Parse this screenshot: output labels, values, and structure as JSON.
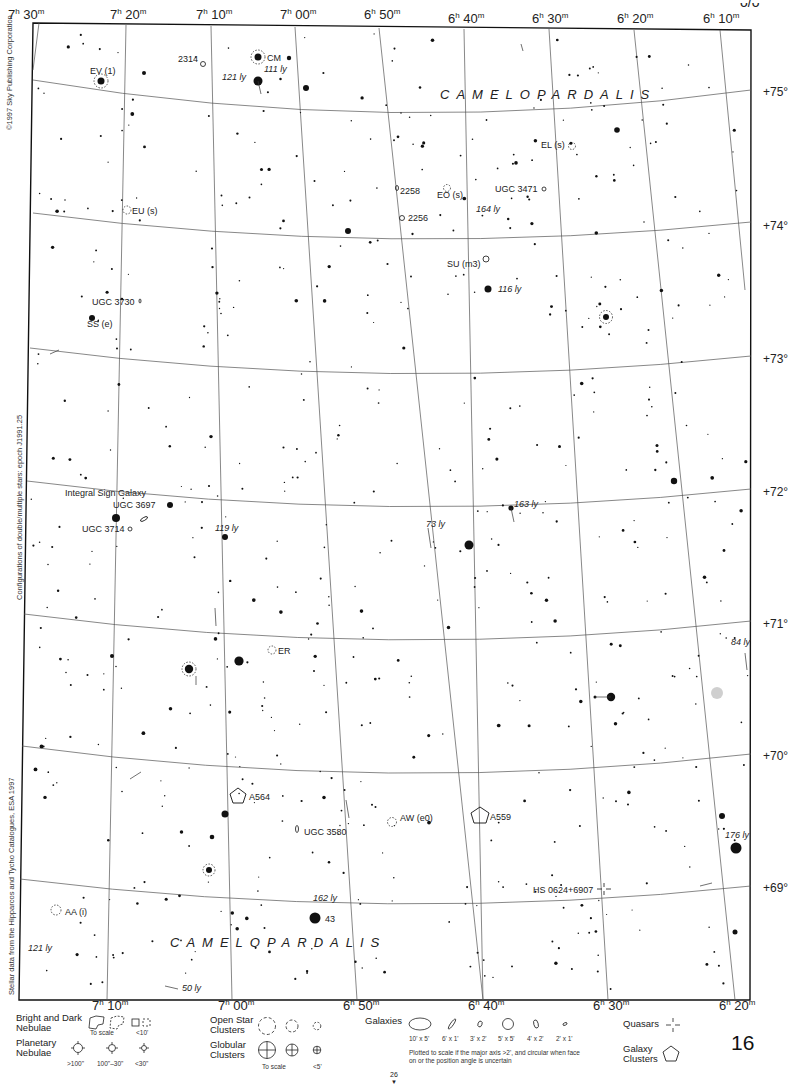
{
  "page": {
    "number": "16",
    "ref_page": "26",
    "top_corner_fragment": "ᴗ/ᴗ"
  },
  "side_text": {
    "copyright": "©1997 Sky Publishing Corporation",
    "epoch_note": "Configurations of double/multiple stars: epoch J1991.25",
    "stellar_data": "Stellar data from the Hipparcos and Tycho Catalogues, ESA 1997"
  },
  "constellation_labels": [
    {
      "text": "CAMELOPARDALIS",
      "x": 440,
      "y": 99
    },
    {
      "text": "CAMELOPARDALIS",
      "x": 170,
      "y": 947
    }
  ],
  "ra_top": [
    {
      "h": "7",
      "m": "30",
      "x": 8,
      "y": 20
    },
    {
      "h": "7",
      "m": "20",
      "x": 110,
      "y": 20
    },
    {
      "h": "7",
      "m": "10",
      "x": 197,
      "y": 20
    },
    {
      "h": "7",
      "m": "00",
      "x": 282,
      "y": 20
    },
    {
      "h": "6",
      "m": "50",
      "x": 365,
      "y": 20
    },
    {
      "h": "6",
      "m": "40",
      "x": 448,
      "y": 24
    },
    {
      "h": "6",
      "m": "30",
      "x": 532,
      "y": 24
    },
    {
      "h": "6",
      "m": "20",
      "x": 617,
      "y": 24
    },
    {
      "h": "6",
      "m": "10",
      "x": 703,
      "y": 24
    }
  ],
  "ra_bottom": [
    {
      "h": "7",
      "m": "10",
      "x": 92,
      "y": 1006
    },
    {
      "h": "7",
      "m": "00",
      "x": 218,
      "y": 1006
    },
    {
      "h": "6",
      "m": "50",
      "x": 343,
      "y": 1006
    },
    {
      "h": "6",
      "m": "40",
      "x": 468,
      "y": 1006
    },
    {
      "h": "6",
      "m": "30",
      "x": 593,
      "y": 1006
    },
    {
      "h": "6",
      "m": "20",
      "x": 719,
      "y": 1006
    }
  ],
  "dec_labels": [
    {
      "text": "+75°",
      "x": 763,
      "y": 96
    },
    {
      "text": "+74°",
      "x": 763,
      "y": 230
    },
    {
      "text": "+73°",
      "x": 763,
      "y": 363
    },
    {
      "text": "+72°",
      "x": 763,
      "y": 496
    },
    {
      "text": "+71°",
      "x": 763,
      "y": 628
    },
    {
      "text": "+70°",
      "x": 763,
      "y": 760
    },
    {
      "text": "+69°",
      "x": 763,
      "y": 892
    }
  ],
  "objects": [
    {
      "label": "2314",
      "x": 178,
      "y": 62,
      "type": "galaxy"
    },
    {
      "label": "CM",
      "x": 267,
      "y": 60,
      "type": "variable"
    },
    {
      "label": "EV (1)",
      "x": 90,
      "y": 74,
      "type": "variable"
    },
    {
      "label": "121 ly",
      "x": 222,
      "y": 79,
      "type": "distance"
    },
    {
      "label": "111 ly",
      "x": 264,
      "y": 72,
      "type": "distance"
    },
    {
      "label": "EL (s)",
      "x": 541,
      "y": 148,
      "type": "variable"
    },
    {
      "label": "2258",
      "x": 398,
      "y": 192,
      "type": "galaxy"
    },
    {
      "label": "EO (s)",
      "x": 437,
      "y": 198,
      "type": "variable"
    },
    {
      "label": "UGC 3471",
      "x": 495,
      "y": 192,
      "type": "galaxy"
    },
    {
      "label": "2256",
      "x": 407,
      "y": 221,
      "type": "galaxy"
    },
    {
      "label": "164 ly",
      "x": 476,
      "y": 212,
      "type": "distance"
    },
    {
      "label": "EU (s)",
      "x": 132,
      "y": 214,
      "type": "variable"
    },
    {
      "label": "SU (m3)",
      "x": 447,
      "y": 266,
      "type": "variable"
    },
    {
      "label": "116 ly",
      "x": 498,
      "y": 292,
      "type": "distance"
    },
    {
      "label": "UGC 3730",
      "x": 92,
      "y": 305,
      "type": "galaxy"
    },
    {
      "label": "SS (e)",
      "x": 87,
      "y": 327,
      "type": "variable"
    },
    {
      "label": "Integral Sign Galaxy",
      "x": 65,
      "y": 495,
      "type": "note"
    },
    {
      "label": "UGC 3697",
      "x": 113,
      "y": 508,
      "type": "galaxy"
    },
    {
      "label": "UGC 3714",
      "x": 82,
      "y": 531,
      "type": "galaxy"
    },
    {
      "label": "119 ly",
      "x": 215,
      "y": 531,
      "type": "distance"
    },
    {
      "label": "163 ly",
      "x": 514,
      "y": 508,
      "type": "distance"
    },
    {
      "label": "73 ly",
      "x": 426,
      "y": 527,
      "type": "distance"
    },
    {
      "label": "ER",
      "x": 278,
      "y": 653,
      "type": "variable"
    },
    {
      "label": "84 ly",
      "x": 731,
      "y": 646,
      "type": "distance"
    },
    {
      "label": "A564",
      "x": 249,
      "y": 799,
      "type": "cluster"
    },
    {
      "label": "UGC 3580",
      "x": 304,
      "y": 834,
      "type": "galaxy"
    },
    {
      "label": "AW (e0)",
      "x": 400,
      "y": 821,
      "type": "variable"
    },
    {
      "label": "A559",
      "x": 490,
      "y": 819,
      "type": "cluster"
    },
    {
      "label": "176 ly",
      "x": 725,
      "y": 838,
      "type": "distance"
    },
    {
      "label": "HS 0624+6907",
      "x": 533,
      "y": 892,
      "type": "quasar"
    },
    {
      "label": "162 ly",
      "x": 313,
      "y": 901,
      "type": "distance"
    },
    {
      "label": "AA (i)",
      "x": 65,
      "y": 915,
      "type": "variable"
    },
    {
      "label": "43",
      "x": 325,
      "y": 922,
      "type": "star"
    },
    {
      "label": "121 ly",
      "x": 28,
      "y": 951,
      "type": "distance"
    },
    {
      "label": "50 ly",
      "x": 182,
      "y": 991,
      "type": "distance"
    }
  ],
  "bright_stars": [
    [
      258,
      81,
      4.5
    ],
    [
      258,
      57,
      3.5
    ],
    [
      101,
      81,
      3.5
    ],
    [
      289,
      58,
      2.2
    ],
    [
      306,
      88,
      3
    ],
    [
      144,
      73,
      2
    ],
    [
      617,
      130,
      2.8
    ],
    [
      348,
      231,
      3
    ],
    [
      488,
      289,
      3.5
    ],
    [
      606,
      317,
      3
    ],
    [
      92,
      318,
      3
    ],
    [
      116,
      518,
      4
    ],
    [
      170,
      505,
      3
    ],
    [
      469,
      545,
      4.5
    ],
    [
      225,
      537,
      3
    ],
    [
      674,
      481,
      3.2
    ],
    [
      511,
      508,
      2.6
    ],
    [
      239,
      661,
      4.6
    ],
    [
      189,
      669,
      4.2
    ],
    [
      611,
      697,
      4.2
    ],
    [
      225,
      814,
      3.5
    ],
    [
      212,
      837,
      2.3
    ],
    [
      209,
      870,
      3
    ],
    [
      722,
      816,
      3
    ],
    [
      736,
      848,
      5.5
    ],
    [
      315,
      918,
      5.5
    ],
    [
      735,
      932,
      2.5
    ],
    [
      112,
      656,
      2
    ],
    [
      595,
      697,
      1.5
    ]
  ],
  "legend": {
    "nebulae_title": "Bright and Dark Nebulae",
    "nebulae_sub1": "To scale",
    "nebulae_sub2": "<10'",
    "planetary_title": "Planetary Nebulae",
    "planetary_sizes": [
      ">100\"",
      "100\"–30\"",
      "<30\""
    ],
    "open_title": "Open Star Clusters",
    "globular_title": "Globular Clusters",
    "globular_sub1": "To scale",
    "globular_sub2": "<5'",
    "galaxies_title": "Galaxies",
    "galaxy_sizes": [
      "10' x 5'",
      "6' x 1'",
      "3' x 2'",
      "5' x 5'",
      "4' x 2'",
      "2' x 1'"
    ],
    "galaxy_note": "Plotted to scale if the major axis >2', and circular when face on or the position angle is uncertain",
    "quasars_title": "Quasars",
    "clusters_title": "Galaxy Clusters"
  }
}
